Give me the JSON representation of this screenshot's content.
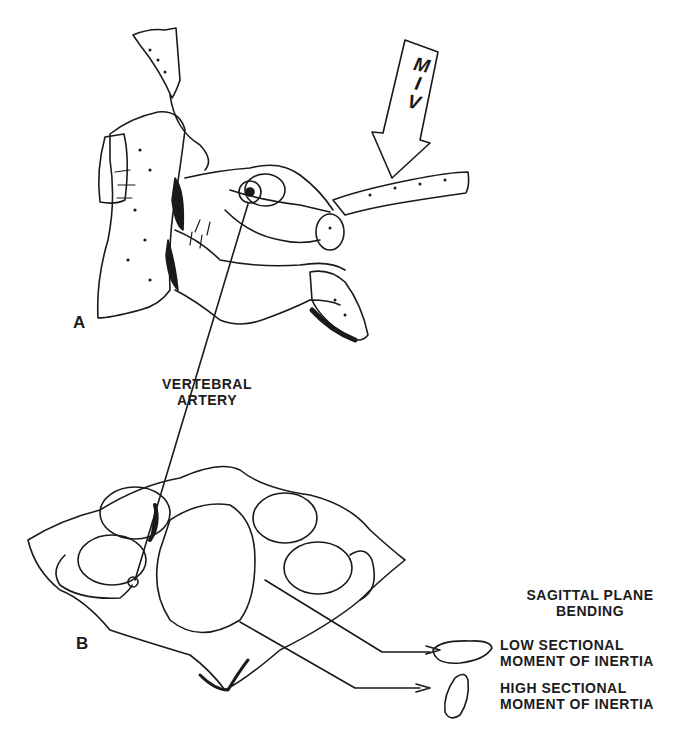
{
  "figure": {
    "panels": [
      {
        "id": "A",
        "label": "A",
        "description": "lateral view of cervical vertebra with force arrow"
      },
      {
        "id": "B",
        "label": "B",
        "description": "superior view of atlas vertebra"
      }
    ],
    "force_arrow": {
      "label_lines": [
        "M",
        "I",
        "V"
      ]
    },
    "annotations": {
      "vertebral_artery": {
        "lines": [
          "VERTEBRAL",
          "ARTERY"
        ]
      },
      "sagittal_heading": {
        "lines": [
          "SAGITTAL PLANE",
          "BENDING"
        ]
      },
      "low_moment": {
        "lines": [
          "LOW SECTIONAL",
          "MOMENT OF INERTIA"
        ]
      },
      "high_moment": {
        "lines": [
          "HIGH SECTIONAL",
          "MOMENT OF INERTIA"
        ]
      }
    },
    "colors": {
      "ink": "#1a1a1a",
      "background": "#ffffff"
    }
  }
}
